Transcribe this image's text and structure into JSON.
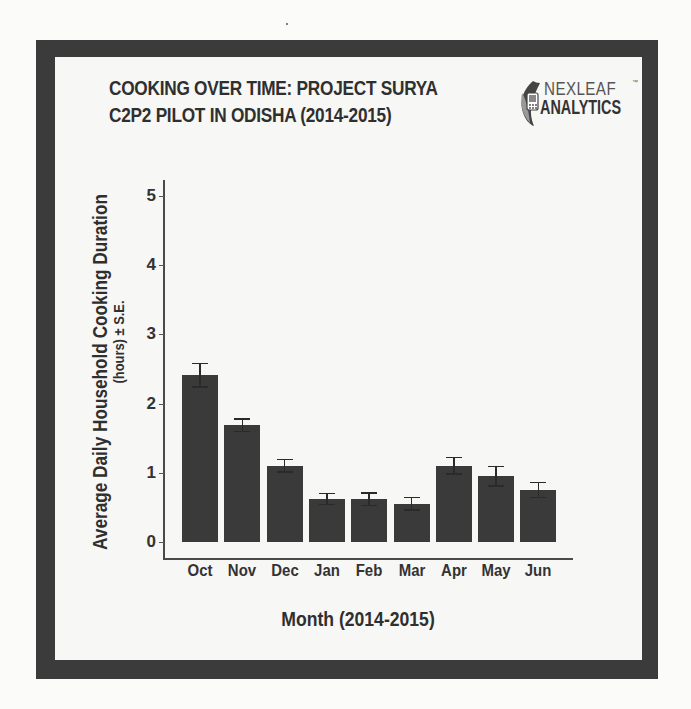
{
  "header": {
    "title_line1": "COOKING OVER TIME: PROJECT SURYA",
    "title_line2": "C2P2 PILOT IN ODISHA (2014-2015)"
  },
  "logo": {
    "line1": "NEXLEAF",
    "line2": "ANALYTICS",
    "trademark": "™",
    "icon": "leaf-phone-icon"
  },
  "colors": {
    "frame": "#3b3b3b",
    "bar": "#3a3a3a",
    "background": "#f7f7f5",
    "text": "#2f2f2f"
  },
  "chart_data": {
    "type": "bar",
    "title": "COOKING OVER TIME: PROJECT SURYA C2P2 PILOT IN ODISHA (2014-2015)",
    "xlabel": "Month (2014-2015)",
    "ylabel": "Average Daily Household Cooking Duration",
    "ylabel_sub": "(hours) ± S.E.",
    "categories": [
      "Oct",
      "Nov",
      "Dec",
      "Jan",
      "Feb",
      "Mar",
      "Apr",
      "May",
      "Jun"
    ],
    "values": [
      2.41,
      1.69,
      1.1,
      0.62,
      0.62,
      0.55,
      1.1,
      0.95,
      0.75
    ],
    "error": [
      0.17,
      0.09,
      0.09,
      0.08,
      0.09,
      0.09,
      0.12,
      0.14,
      0.11
    ],
    "error_type": "standard error",
    "yticks": [
      0,
      1,
      2,
      3,
      4,
      5
    ],
    "ylim": [
      0,
      5.2
    ],
    "grid": false,
    "legend": null
  }
}
